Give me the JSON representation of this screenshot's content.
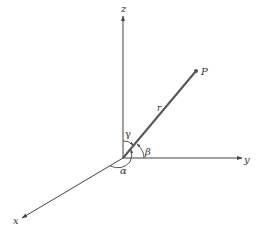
{
  "diagram": {
    "colors": {
      "background": "#ffffff",
      "axis": "#444444",
      "vector": "#555555",
      "text": "#333333"
    },
    "axes": {
      "z_label": "z",
      "y_label": "y",
      "x_label": "x"
    },
    "point": {
      "label": "P"
    },
    "vector": {
      "label": "r"
    },
    "angles": {
      "alpha": "α",
      "beta": "β",
      "gamma": "γ"
    }
  }
}
